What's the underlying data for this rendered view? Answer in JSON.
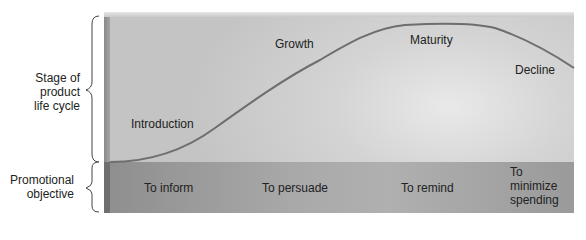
{
  "diagram": {
    "type": "product-life-cycle",
    "row_labels": {
      "stage": [
        "Stage of",
        "product",
        "life cycle"
      ],
      "objective": [
        "Promotional",
        "objective"
      ]
    },
    "stages": [
      {
        "label": "Introduction"
      },
      {
        "label": "Growth"
      },
      {
        "label": "Maturity"
      },
      {
        "label": "Decline"
      }
    ],
    "objectives": [
      {
        "lines": [
          "To inform"
        ]
      },
      {
        "lines": [
          "To persuade"
        ]
      },
      {
        "lines": [
          "To remind"
        ]
      },
      {
        "lines": [
          "To",
          "minimize",
          "spending"
        ]
      }
    ],
    "colors": {
      "curve": "#6e6e6e",
      "upper_band": "#d4d4d4",
      "lower_band": "#a6a6a6"
    }
  }
}
